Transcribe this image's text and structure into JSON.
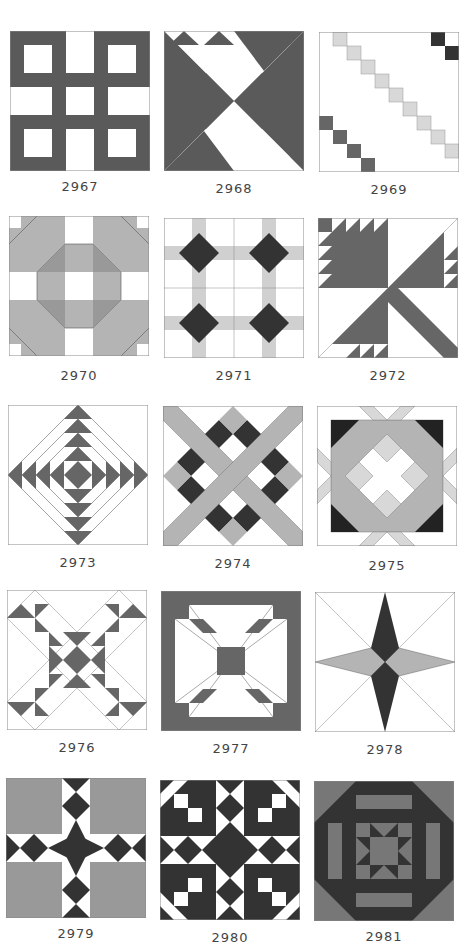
{
  "colors": {
    "dark": "#5a5a5a",
    "darker": "#333333",
    "mid": "#8c8c8c",
    "light": "#b4b4b4",
    "pale": "#d8d8d8",
    "white": "#ffffff",
    "outline": "#888888",
    "label": "#444444"
  },
  "blocks": [
    {
      "number": "2967",
      "pattern": "window-lattice"
    },
    {
      "number": "2968",
      "pattern": "pinwheel-spiral"
    },
    {
      "number": "2969",
      "pattern": "diagonal-steps"
    },
    {
      "number": "2970",
      "pattern": "octagon-ring"
    },
    {
      "number": "2971",
      "pattern": "four-crossed-squares"
    },
    {
      "number": "2972",
      "pattern": "tulip-sawtooth"
    },
    {
      "number": "2973",
      "pattern": "nested-diamonds"
    },
    {
      "number": "2974",
      "pattern": "crossed-bands-checker"
    },
    {
      "number": "2975",
      "pattern": "star-in-octagon"
    },
    {
      "number": "2976",
      "pattern": "triangle-x"
    },
    {
      "number": "2977",
      "pattern": "framed-square-arrows"
    },
    {
      "number": "2978",
      "pattern": "four-point-star"
    },
    {
      "number": "2979",
      "pattern": "diamond-cross"
    },
    {
      "number": "2980",
      "pattern": "diamond-triangles"
    },
    {
      "number": "2981",
      "pattern": "octagon-star-frame"
    }
  ]
}
